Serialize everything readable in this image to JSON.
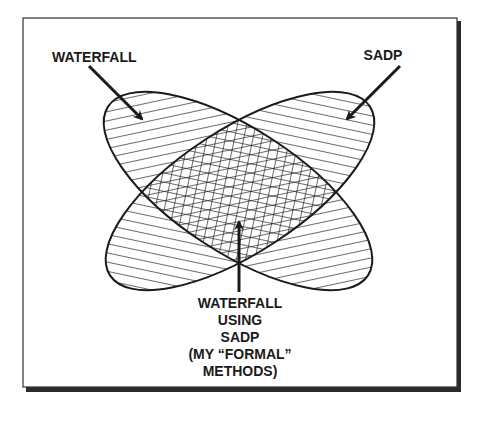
{
  "diagram": {
    "labels": {
      "waterfall": "WATERFALL",
      "sadp": "SADP",
      "intersection": [
        "WATERFALL",
        "USING",
        "SADP",
        "(MY “FORMAL”",
        "METHODS)"
      ]
    },
    "sets": [
      {
        "name": "WATERFALL",
        "hatch": "backslash"
      },
      {
        "name": "SADP",
        "hatch": "forward-slash"
      }
    ],
    "intersection_hatch": "crosshatch",
    "colors": {
      "ink": "#1a1a1a",
      "frame": "#333333",
      "background": "#ffffff"
    }
  }
}
